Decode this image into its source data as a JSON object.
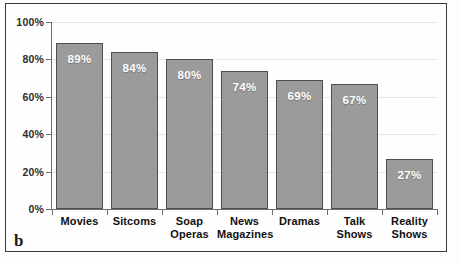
{
  "figure": {
    "panel_letter": "b",
    "border_color": "#3a3a3a",
    "background": "#fefefe"
  },
  "chart_data": {
    "type": "bar",
    "title": "",
    "subtitle": "",
    "xlabel": "",
    "ylabel": "",
    "categories": [
      "Movies",
      "Sitcoms",
      "Soap Operas",
      "News Magazines",
      "Dramas",
      "Talk Shows",
      "Reality Shows"
    ],
    "category_lines": [
      [
        "Movies"
      ],
      [
        "Sitcoms"
      ],
      [
        "Soap",
        "Operas"
      ],
      [
        "News",
        "Magazines"
      ],
      [
        "Dramas"
      ],
      [
        "Talk",
        "Shows"
      ],
      [
        "Reality",
        "Shows"
      ]
    ],
    "values": [
      89,
      84,
      80,
      74,
      69,
      67,
      27
    ],
    "value_labels": [
      "89%",
      "84%",
      "80%",
      "74%",
      "69%",
      "67%",
      "27%"
    ],
    "ylim": [
      0,
      100
    ],
    "yticks": [
      0,
      20,
      40,
      60,
      80,
      100
    ],
    "ytick_labels": [
      "0%",
      "20%",
      "40%",
      "60%",
      "80%",
      "100%"
    ],
    "grid": true,
    "legend": null,
    "bar_color": "#9b9b9b",
    "bar_edge_color": "#4f4f4f",
    "value_label_color": "#ffffff",
    "axis_color": "#6d6d6d",
    "gridline_color": "#e6e6e4"
  }
}
